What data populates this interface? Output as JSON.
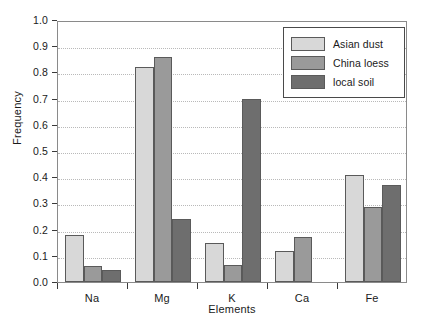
{
  "chart_data": {
    "type": "bar",
    "title": "",
    "xlabel": "Elements",
    "ylabel": "Frequency",
    "categories": [
      "Na",
      "Mg",
      "K",
      "Ca",
      "Fe"
    ],
    "ylim": [
      0.0,
      1.0
    ],
    "ytick_step": 0.1,
    "yticks": [
      "1.0",
      "0.9",
      "0.8",
      "0.7",
      "0.6",
      "0.5",
      "0.4",
      "0.3",
      "0.2",
      "0.1",
      "0.0"
    ],
    "ytick_values": [
      1.0,
      0.9,
      0.8,
      0.7,
      0.6,
      0.5,
      0.4,
      0.3,
      0.2,
      0.1,
      0.0
    ],
    "grid": true,
    "grid_axis": "y",
    "legend_position": "top-right",
    "series": [
      {
        "name": "Asian dust",
        "color": "#d8d8d8",
        "values": [
          0.18,
          0.82,
          0.15,
          0.12,
          0.41
        ]
      },
      {
        "name": "China loess",
        "color": "#9a9a9a",
        "values": [
          0.06,
          0.86,
          0.065,
          0.17,
          0.285
        ]
      },
      {
        "name": "local soil",
        "color": "#6e6e6e",
        "values": [
          0.045,
          0.24,
          0.7,
          null,
          0.37
        ]
      }
    ]
  }
}
